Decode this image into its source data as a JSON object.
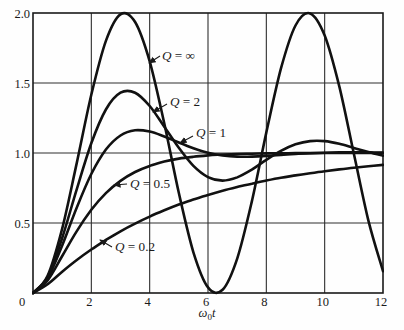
{
  "figure": {
    "background": "#fefefe",
    "ink": "#1a1a1a",
    "grid_color": "#2e2e2e",
    "curve_color": "#111111"
  },
  "chart_data": {
    "type": "line",
    "title": "",
    "xlabel": {
      "symbol": "ω",
      "sub": "0",
      "var": "t"
    },
    "ylabel": "",
    "xlim": [
      0,
      12
    ],
    "ylim": [
      0,
      2
    ],
    "grid": true,
    "legend_position": "inline-annotations",
    "xticks": [
      {
        "v": 0,
        "label": "0"
      },
      {
        "v": 2,
        "label": "2"
      },
      {
        "v": 4,
        "label": "4"
      },
      {
        "v": 6,
        "label": "6"
      },
      {
        "v": 8,
        "label": "8"
      },
      {
        "v": 10,
        "label": "10"
      },
      {
        "v": 12,
        "label": "12"
      }
    ],
    "yticks": [
      {
        "v": 0.5,
        "label": "0.5"
      },
      {
        "v": 1.0,
        "label": "1.0"
      },
      {
        "v": 1.5,
        "label": "1.5"
      },
      {
        "v": 2.0,
        "label": "2.0"
      }
    ],
    "x_start": 0,
    "x_step": 0.5,
    "series": [
      {
        "id": "q-inf",
        "name": "Q = ∞",
        "Q": "∞",
        "values": [
          0,
          0.122,
          0.46,
          0.929,
          1.416,
          1.801,
          1.99,
          1.936,
          1.654,
          1.211,
          0.716,
          0.291,
          0.04,
          0.023,
          0.246,
          0.653,
          1.146,
          1.602,
          1.911,
          1.997,
          1.839,
          1.476,
          0.996,
          0.517,
          0.156
        ]
      },
      {
        "id": "q-2",
        "name": "Q = 2",
        "Q": "2",
        "values": [
          0,
          0.113,
          0.393,
          0.742,
          1.07,
          1.311,
          1.431,
          1.431,
          1.336,
          1.188,
          1.037,
          0.908,
          0.828,
          0.803,
          0.826,
          0.881,
          0.951,
          1.015,
          1.062,
          1.085,
          1.085,
          1.066,
          1.036,
          1.007,
          0.981
        ]
      },
      {
        "id": "q-1",
        "name": "Q = 1",
        "Q": "1",
        "values": [
          0,
          0.104,
          0.34,
          0.611,
          0.85,
          1.024,
          1.125,
          1.162,
          1.153,
          1.118,
          1.075,
          1.034,
          1.002,
          0.983,
          0.974,
          0.974,
          0.979,
          0.986,
          0.993,
          0.998,
          1.002,
          1.004,
          1.004,
          1.004,
          1.003
        ]
      },
      {
        "id": "q-0.5",
        "name": "Q = 0.5",
        "Q": "0.5",
        "values": [
          0,
          0.09,
          0.264,
          0.442,
          0.594,
          0.713,
          0.801,
          0.864,
          0.908,
          0.939,
          0.96,
          0.973,
          0.983,
          0.989,
          0.993,
          0.995,
          0.997,
          0.998,
          0.999,
          0.999,
          1.0,
          1.0,
          1.0,
          1.0,
          1.0
        ]
      },
      {
        "id": "q-0.2",
        "name": "Q = 0.2",
        "Q": "0.2",
        "values": [
          0,
          0.062,
          0.152,
          0.236,
          0.311,
          0.379,
          0.441,
          0.496,
          0.546,
          0.591,
          0.632,
          0.668,
          0.701,
          0.731,
          0.757,
          0.781,
          0.803,
          0.823,
          0.84,
          0.856,
          0.87,
          0.883,
          0.895,
          0.905,
          0.915
        ]
      }
    ],
    "annotations": [
      {
        "text": "Q = ∞",
        "tx": 162,
        "ty": 60,
        "arrow": [
          160,
          56,
          149,
          63
        ]
      },
      {
        "text": "Q = 2",
        "tx": 170,
        "ty": 106,
        "arrow": [
          167,
          104,
          153,
          112
        ]
      },
      {
        "text": "Q = 1",
        "tx": 196,
        "ty": 137,
        "arrow": [
          193,
          136,
          180,
          143
        ]
      },
      {
        "text": "Q = 0.5",
        "tx": 130,
        "ty": 188,
        "arrow": [
          127,
          184,
          114,
          185
        ]
      },
      {
        "text": "Q = 0.2",
        "tx": 115,
        "ty": 251,
        "arrow": [
          112,
          247,
          100,
          240
        ]
      }
    ]
  }
}
